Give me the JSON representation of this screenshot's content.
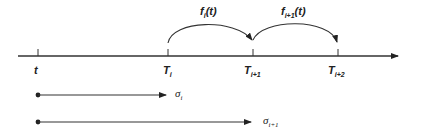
{
  "diagram": {
    "axis": {
      "start_x": 18,
      "end_x": 400,
      "y": 56
    },
    "ticks": [
      {
        "x": 38,
        "label": "t",
        "sub": ""
      },
      {
        "x": 168,
        "label": "T",
        "sub": "i"
      },
      {
        "x": 253,
        "label": "T",
        "sub": "i+1"
      },
      {
        "x": 338,
        "label": "T",
        "sub": "i+2"
      }
    ],
    "arcs": [
      {
        "from": 168,
        "to": 253,
        "label": "f",
        "sub": "i",
        "suffix": "(t)"
      },
      {
        "from": 253,
        "to": 338,
        "label": "f",
        "sub": "i+1",
        "suffix": "(t)"
      }
    ],
    "intervals": [
      {
        "from": 38,
        "to": 167,
        "y": 95,
        "label": "σ",
        "sub": "i"
      },
      {
        "from": 38,
        "to": 252,
        "y": 122,
        "label": "σ",
        "sub": "i+1"
      }
    ],
    "line_color": "#333333"
  }
}
